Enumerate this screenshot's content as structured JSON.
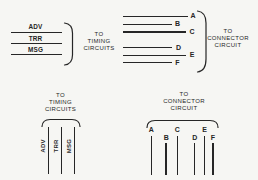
{
  "colors": {
    "background": "#f6f6f3",
    "ink": "#262626"
  },
  "top_left_group": {
    "signals": [
      "ADV",
      "TRR",
      "MSG"
    ],
    "destination_lines": [
      "TO",
      "TIMING",
      "CIRCUITS"
    ]
  },
  "top_right_group": {
    "signals": [
      "A",
      "B",
      "C",
      "D",
      "E",
      "F"
    ],
    "destination_lines": [
      "TO",
      "CONNECTOR",
      "CIRCUIT"
    ]
  },
  "bottom_left_group": {
    "destination_lines": [
      "TO",
      "TIMING",
      "CIRCUITS"
    ],
    "signals": [
      "ADV",
      "TRR",
      "MSG"
    ]
  },
  "bottom_right_group": {
    "destination_lines": [
      "TO",
      "CONNECTOR",
      "CIRCUIT"
    ],
    "signals": [
      "A",
      "B",
      "C",
      "D",
      "E",
      "F"
    ]
  }
}
